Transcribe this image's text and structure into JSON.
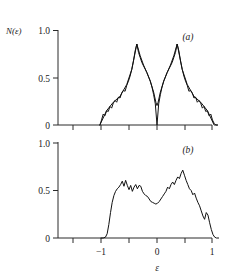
{
  "figure": {
    "ylabel": "N(ε)",
    "xlabel": "ε",
    "panel_a_label": "(a)",
    "panel_b_label": "(b)",
    "ink_color": "#111111",
    "background": "#ffffff"
  },
  "axes": {
    "y_ticks": [
      "1.0",
      "0.5",
      "0"
    ],
    "x_ticks": [
      "-1",
      "0",
      "1"
    ],
    "x_tick_minus_one": "−1",
    "x_tick_zero": "0",
    "x_tick_one": "1",
    "y_tick_one": "1.0",
    "y_tick_half": "0.5",
    "y_tick_zero": "0"
  },
  "chart_data": [
    {
      "type": "line",
      "panel": "a",
      "title": "",
      "xlabel": "",
      "ylabel": "N(ε)",
      "xlim": [
        -1.45,
        1.45
      ],
      "ylim": [
        0,
        1.12
      ],
      "xticks": [
        -1,
        0,
        1
      ],
      "yticks": [
        0,
        0.5,
        1.0
      ],
      "grid": false,
      "legend": "none",
      "series": [
        {
          "name": "jagged-data",
          "x": [
            -1.02,
            -0.99,
            -0.96,
            -0.93,
            -0.9,
            -0.87,
            -0.84,
            -0.81,
            -0.78,
            -0.75,
            -0.72,
            -0.69,
            -0.66,
            -0.63,
            -0.6,
            -0.57,
            -0.54,
            -0.51,
            -0.48,
            -0.45,
            -0.42,
            -0.39,
            -0.36,
            -0.33,
            -0.3,
            -0.27,
            -0.24,
            -0.21,
            -0.18,
            -0.15,
            -0.12,
            -0.09,
            -0.06,
            -0.03,
            0.0,
            0.03,
            0.06,
            0.09,
            0.12,
            0.15,
            0.18,
            0.21,
            0.24,
            0.27,
            0.3,
            0.33,
            0.36,
            0.39,
            0.42,
            0.45,
            0.48,
            0.51,
            0.54,
            0.57,
            0.6,
            0.63,
            0.66,
            0.69,
            0.72,
            0.75,
            0.78,
            0.81,
            0.84,
            0.87,
            0.9,
            0.93,
            0.96,
            0.99,
            1.02,
            1.05,
            1.08
          ],
          "y": [
            0.0,
            0.06,
            0.13,
            0.11,
            0.17,
            0.16,
            0.22,
            0.2,
            0.26,
            0.29,
            0.27,
            0.33,
            0.32,
            0.38,
            0.41,
            0.4,
            0.47,
            0.52,
            0.58,
            0.66,
            0.76,
            0.88,
            0.96,
            0.86,
            0.8,
            0.74,
            0.7,
            0.66,
            0.62,
            0.57,
            0.52,
            0.45,
            0.36,
            0.25,
            0.0,
            0.25,
            0.36,
            0.45,
            0.52,
            0.57,
            0.62,
            0.66,
            0.7,
            0.74,
            0.8,
            0.86,
            0.96,
            0.88,
            0.76,
            0.66,
            0.58,
            0.52,
            0.47,
            0.4,
            0.41,
            0.38,
            0.32,
            0.33,
            0.27,
            0.29,
            0.26,
            0.2,
            0.22,
            0.16,
            0.17,
            0.11,
            0.13,
            0.06,
            0.02,
            0.0,
            0.0
          ]
        },
        {
          "name": "smooth-envelope",
          "x": [
            -1.02,
            -0.9,
            -0.78,
            -0.66,
            -0.54,
            -0.45,
            -0.36,
            -0.3,
            -0.24,
            -0.18,
            -0.12,
            -0.06,
            -0.02,
            0.0,
            0.02,
            0.06,
            0.12,
            0.18,
            0.24,
            0.3,
            0.36,
            0.45,
            0.54,
            0.66,
            0.78,
            0.9,
            1.02,
            1.08
          ],
          "y": [
            0.0,
            0.17,
            0.27,
            0.34,
            0.48,
            0.66,
            0.96,
            0.82,
            0.71,
            0.62,
            0.52,
            0.39,
            0.27,
            0.23,
            0.27,
            0.39,
            0.52,
            0.62,
            0.71,
            0.82,
            0.96,
            0.66,
            0.48,
            0.34,
            0.27,
            0.17,
            0.0,
            0.0
          ]
        }
      ]
    },
    {
      "type": "line",
      "panel": "b",
      "title": "",
      "xlabel": "ε",
      "ylabel": "",
      "xlim": [
        -1.45,
        1.45
      ],
      "ylim": [
        0,
        1.12
      ],
      "xticks": [
        -1,
        0,
        1
      ],
      "yticks": [
        0,
        0.5,
        1.0
      ],
      "grid": false,
      "legend": "none",
      "series": [
        {
          "name": "dos-curve",
          "x": [
            -1.0,
            -0.96,
            -0.92,
            -0.89,
            -0.86,
            -0.83,
            -0.8,
            -0.77,
            -0.74,
            -0.71,
            -0.68,
            -0.65,
            -0.62,
            -0.59,
            -0.56,
            -0.53,
            -0.5,
            -0.47,
            -0.44,
            -0.41,
            -0.38,
            -0.35,
            -0.32,
            -0.29,
            -0.26,
            -0.23,
            -0.2,
            -0.17,
            -0.14,
            -0.11,
            -0.08,
            -0.05,
            -0.02,
            0.01,
            0.04,
            0.07,
            0.1,
            0.13,
            0.16,
            0.19,
            0.22,
            0.25,
            0.28,
            0.31,
            0.34,
            0.37,
            0.4,
            0.43,
            0.46,
            0.49,
            0.52,
            0.55,
            0.58,
            0.61,
            0.64,
            0.67,
            0.7,
            0.73,
            0.76,
            0.79,
            0.82,
            0.85,
            0.88,
            0.91,
            0.94,
            0.97,
            1.0,
            1.03,
            1.06,
            1.1
          ],
          "y": [
            0.0,
            0.0,
            0.01,
            0.05,
            0.16,
            0.3,
            0.42,
            0.5,
            0.55,
            0.58,
            0.6,
            0.63,
            0.67,
            0.61,
            0.68,
            0.62,
            0.57,
            0.62,
            0.55,
            0.6,
            0.63,
            0.58,
            0.62,
            0.61,
            0.55,
            0.52,
            0.5,
            0.49,
            0.46,
            0.43,
            0.42,
            0.41,
            0.4,
            0.41,
            0.43,
            0.46,
            0.49,
            0.52,
            0.55,
            0.6,
            0.58,
            0.63,
            0.66,
            0.63,
            0.68,
            0.72,
            0.7,
            0.76,
            0.8,
            0.74,
            0.68,
            0.63,
            0.58,
            0.56,
            0.51,
            0.53,
            0.47,
            0.42,
            0.38,
            0.32,
            0.26,
            0.22,
            0.3,
            0.27,
            0.18,
            0.1,
            0.04,
            0.01,
            0.0,
            0.0
          ]
        }
      ]
    }
  ]
}
